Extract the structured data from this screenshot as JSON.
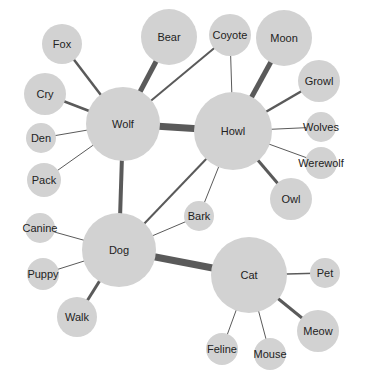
{
  "diagram": {
    "type": "network-graph",
    "colors": {
      "node_fill": "#d2d2d2",
      "edge_stroke": "#5a5a5a",
      "label": "#222222",
      "background": "#ffffff"
    },
    "nodes": [
      {
        "id": "fox",
        "label": "Fox",
        "x": 62,
        "y": 44,
        "r": 20
      },
      {
        "id": "bear",
        "label": "Bear",
        "x": 169,
        "y": 37,
        "r": 28
      },
      {
        "id": "coyote",
        "label": "Coyote",
        "x": 230,
        "y": 35,
        "r": 21
      },
      {
        "id": "moon",
        "label": "Moon",
        "x": 284,
        "y": 38,
        "r": 28
      },
      {
        "id": "growl",
        "label": "Growl",
        "x": 319,
        "y": 81,
        "r": 21
      },
      {
        "id": "cry",
        "label": "Cry",
        "x": 45,
        "y": 94,
        "r": 21
      },
      {
        "id": "wolf",
        "label": "Wolf",
        "x": 123,
        "y": 124,
        "r": 37
      },
      {
        "id": "howl",
        "label": "Howl",
        "x": 233,
        "y": 131,
        "r": 39
      },
      {
        "id": "wolves",
        "label": "Wolves",
        "x": 321,
        "y": 127,
        "r": 15
      },
      {
        "id": "den",
        "label": "Den",
        "x": 41,
        "y": 138,
        "r": 15
      },
      {
        "id": "werewolf",
        "label": "Werewolf",
        "x": 321,
        "y": 163,
        "r": 16
      },
      {
        "id": "pack",
        "label": "Pack",
        "x": 44,
        "y": 180,
        "r": 17
      },
      {
        "id": "owl",
        "label": "Owl",
        "x": 291,
        "y": 199,
        "r": 21
      },
      {
        "id": "bark",
        "label": "Bark",
        "x": 199,
        "y": 216,
        "r": 15
      },
      {
        "id": "canine",
        "label": "Canine",
        "x": 40,
        "y": 228,
        "r": 15
      },
      {
        "id": "dog",
        "label": "Dog",
        "x": 119,
        "y": 250,
        "r": 37
      },
      {
        "id": "cat",
        "label": "Cat",
        "x": 249,
        "y": 275,
        "r": 38
      },
      {
        "id": "pet",
        "label": "Pet",
        "x": 325,
        "y": 273,
        "r": 15
      },
      {
        "id": "puppy",
        "label": "Puppy",
        "x": 43,
        "y": 274,
        "r": 16
      },
      {
        "id": "walk",
        "label": "Walk",
        "x": 77,
        "y": 317,
        "r": 20
      },
      {
        "id": "meow",
        "label": "Meow",
        "x": 318,
        "y": 331,
        "r": 21
      },
      {
        "id": "feline",
        "label": "Feline",
        "x": 222,
        "y": 349,
        "r": 16
      },
      {
        "id": "mouse",
        "label": "Mouse",
        "x": 270,
        "y": 354,
        "r": 16
      }
    ],
    "edges": [
      {
        "source": "wolf",
        "target": "howl",
        "weight": 7
      },
      {
        "source": "wolf",
        "target": "dog",
        "weight": 4
      },
      {
        "source": "wolf",
        "target": "bear",
        "weight": 5
      },
      {
        "source": "wolf",
        "target": "coyote",
        "weight": 2
      },
      {
        "source": "wolf",
        "target": "fox",
        "weight": 2.5
      },
      {
        "source": "wolf",
        "target": "cry",
        "weight": 2.5
      },
      {
        "source": "wolf",
        "target": "den",
        "weight": 1
      },
      {
        "source": "wolf",
        "target": "pack",
        "weight": 1
      },
      {
        "source": "howl",
        "target": "coyote",
        "weight": 1
      },
      {
        "source": "howl",
        "target": "moon",
        "weight": 5
      },
      {
        "source": "howl",
        "target": "growl",
        "weight": 2.5
      },
      {
        "source": "howl",
        "target": "wolves",
        "weight": 1
      },
      {
        "source": "howl",
        "target": "werewolf",
        "weight": 1
      },
      {
        "source": "howl",
        "target": "owl",
        "weight": 3
      },
      {
        "source": "howl",
        "target": "bark",
        "weight": 1
      },
      {
        "source": "howl",
        "target": "dog",
        "weight": 2
      },
      {
        "source": "dog",
        "target": "bark",
        "weight": 1
      },
      {
        "source": "dog",
        "target": "cat",
        "weight": 7
      },
      {
        "source": "dog",
        "target": "canine",
        "weight": 1
      },
      {
        "source": "dog",
        "target": "puppy",
        "weight": 1
      },
      {
        "source": "dog",
        "target": "walk",
        "weight": 3
      },
      {
        "source": "cat",
        "target": "pet",
        "weight": 1.5
      },
      {
        "source": "cat",
        "target": "meow",
        "weight": 3
      },
      {
        "source": "cat",
        "target": "feline",
        "weight": 1
      },
      {
        "source": "cat",
        "target": "mouse",
        "weight": 1
      }
    ]
  }
}
